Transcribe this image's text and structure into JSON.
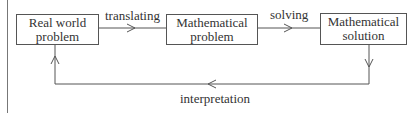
{
  "diagram": {
    "type": "flowchart-cycle",
    "nodes": [
      {
        "id": "real",
        "line1": "Real world",
        "line2": "problem"
      },
      {
        "id": "mathproblem",
        "line1": "Mathematical",
        "line2": "problem"
      },
      {
        "id": "mathsolution",
        "line1": "Mathematical",
        "line2": "solution"
      }
    ],
    "edges": [
      {
        "from": "real",
        "to": "mathproblem",
        "label": "translating"
      },
      {
        "from": "mathproblem",
        "to": "mathsolution",
        "label": "solving"
      },
      {
        "from": "mathsolution",
        "to": "real",
        "label": "interpretation"
      }
    ],
    "colors": {
      "line": "#555555",
      "text": "#333333",
      "background": "#ffffff"
    }
  }
}
